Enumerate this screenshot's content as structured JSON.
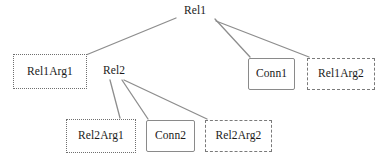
{
  "diagram": {
    "edge_color": "#8d8d8d",
    "text_color": "#1a1a1a",
    "background": "#ffffff",
    "nodes": [
      {
        "id": "rel1",
        "label": "Rel1",
        "style": "plain",
        "x": 178,
        "y": 3,
        "w": 34,
        "h": 16
      },
      {
        "id": "rel1arg1",
        "label": "Rel1Arg1",
        "style": "dotted",
        "border_color": "#6f6f6f",
        "x": 13,
        "y": 54,
        "w": 74,
        "h": 35
      },
      {
        "id": "rel2",
        "label": "Rel2",
        "style": "plain",
        "x": 96,
        "y": 63,
        "w": 36,
        "h": 16
      },
      {
        "id": "conn1",
        "label": "Conn1",
        "style": "solid",
        "border_color": "#8a8a8a",
        "x": 248,
        "y": 58,
        "w": 47,
        "h": 32
      },
      {
        "id": "rel1arg2",
        "label": "Rel1Arg2",
        "style": "dashed",
        "border_color": "#7a7a7a",
        "x": 307,
        "y": 58,
        "w": 68,
        "h": 32
      },
      {
        "id": "rel2arg1",
        "label": "Rel2Arg1",
        "style": "dotted",
        "border_color": "#6f6f6f",
        "x": 66,
        "y": 119,
        "w": 70,
        "h": 34
      },
      {
        "id": "conn2",
        "label": "Conn2",
        "style": "solid",
        "border_color": "#8a8a8a",
        "x": 146,
        "y": 120,
        "w": 49,
        "h": 32
      },
      {
        "id": "rel2arg2",
        "label": "Rel2Arg2",
        "style": "dashed",
        "border_color": "#7a7a7a",
        "x": 205,
        "y": 120,
        "w": 67,
        "h": 32
      }
    ],
    "edges": [
      {
        "id": "rel1-rel1arg1",
        "from": "rel1",
        "to": "rel1arg1",
        "x1": 176,
        "y1": 18,
        "x2": 86,
        "y2": 55
      },
      {
        "id": "rel1-conn1",
        "from": "rel1",
        "to": "conn1",
        "x1": 215,
        "y1": 19,
        "x2": 250,
        "y2": 57
      },
      {
        "id": "rel1-rel1arg2",
        "from": "rel1",
        "to": "rel1arg2",
        "x1": 216,
        "y1": 21,
        "x2": 309,
        "y2": 57
      },
      {
        "id": "rel2-rel2arg1",
        "from": "rel2",
        "to": "rel2arg1",
        "x1": 110,
        "y1": 80,
        "x2": 120,
        "y2": 118
      },
      {
        "id": "rel2-conn2",
        "from": "rel2",
        "to": "conn2",
        "x1": 122,
        "y1": 80,
        "x2": 148,
        "y2": 119
      },
      {
        "id": "rel2-rel2arg2",
        "from": "rel2",
        "to": "rel2arg2",
        "x1": 124,
        "y1": 80,
        "x2": 207,
        "y2": 119
      }
    ]
  }
}
